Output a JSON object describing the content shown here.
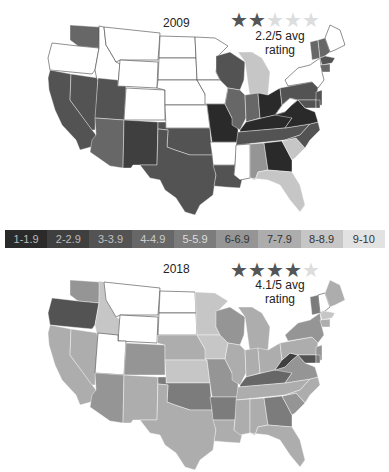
{
  "chart_data": {
    "type": "choropleth",
    "title": "",
    "legend": {
      "bins": [
        "1-1.9",
        "2-2.9",
        "3-3.9",
        "4-4.9",
        "5-5.9",
        "6-6.9",
        "7-7.9",
        "8-8.9",
        "9-10"
      ],
      "colors": [
        "#2a2a2a",
        "#3f3f3f",
        "#535353",
        "#676767",
        "#7c7c7c",
        "#959595",
        "#adadad",
        "#c6c6c6",
        "#e2e2e2"
      ],
      "text_colors": [
        "#bbbbbb",
        "#bbbbbb",
        "#c0c0c0",
        "#cccccc",
        "#dddddd",
        "#333333",
        "#333333",
        "#333333",
        "#333333"
      ]
    },
    "maps": [
      {
        "year": "2009",
        "stars_filled": 2,
        "stars_total": 5,
        "rating_label": "2.2/5 avg rating",
        "states": {
          "WA": "4-4.9",
          "OR": "none",
          "CA": "3-3.9",
          "NV": "3-3.9",
          "ID": "none",
          "MT": "none",
          "WY": "none",
          "UT": "3-3.9",
          "CO": "none",
          "AZ": "4-4.9",
          "NM": "2-2.9",
          "ND": "none",
          "SD": "none",
          "NE": "none",
          "KS": "none",
          "OK": "3-3.9",
          "TX": "3-3.9",
          "MN": "none",
          "IA": "none",
          "MO": "1-1.9",
          "AR": "none",
          "LA": "3-3.9",
          "WI": "3-3.9",
          "IL": "4-4.9",
          "MI": "8-8.9",
          "IN": "4-4.9",
          "OH": "1-1.9",
          "KY": "1-1.9",
          "TN": "3-3.9",
          "MS": "none",
          "AL": "6-6.9",
          "GA": "1-1.9",
          "FL": "8-8.9",
          "SC": "8-8.9",
          "NC": "3-3.9",
          "VA": "1-1.9",
          "WV": "none",
          "PA": "3-3.9",
          "NY": "none",
          "VT": "4-4.9",
          "NH": "4-4.9",
          "ME": "none",
          "MA": "3-3.9",
          "CT": "4-4.9",
          "NJ": "3-3.9",
          "MD": "3-3.9",
          "DE": "3-3.9"
        }
      },
      {
        "year": "2018",
        "stars_filled": 4,
        "stars_total": 5,
        "rating_label": "4.1/5 avg rating",
        "states": {
          "WA": "6-6.9",
          "OR": "3-3.9",
          "CA": "7-7.9",
          "NV": "7-7.9",
          "ID": "8-8.9",
          "MT": "none",
          "WY": "none",
          "UT": "none",
          "CO": "6-6.9",
          "AZ": "6-6.9",
          "NM": "7-7.9",
          "ND": "none",
          "SD": "none",
          "NE": "7-7.9",
          "KS": "8-8.9",
          "OK": "5-5.9",
          "TX": "7-7.9",
          "MN": "8-8.9",
          "IA": "8-8.9",
          "MO": "6-6.9",
          "AR": "5-5.9",
          "LA": "7-7.9",
          "WI": "6-6.9",
          "IL": "7-7.9",
          "MI": "7-7.9",
          "IN": "7-7.9",
          "OH": "7-7.9",
          "KY": "4-4.9",
          "TN": "7-7.9",
          "MS": "7-7.9",
          "AL": "7-7.9",
          "GA": "5-5.9",
          "FL": "7-7.9",
          "SC": "6-6.9",
          "NC": "7-7.9",
          "VA": "6-6.9",
          "WV": "2-2.9",
          "PA": "7-7.9",
          "NY": "6-6.9",
          "VT": "5-5.9",
          "NH": "none",
          "ME": "7-7.9",
          "MA": "8-8.9",
          "CT": "7-7.9",
          "NJ": "6-6.9",
          "MD": "3-3.9",
          "DE": "5-5.9"
        }
      }
    ]
  },
  "panels": {
    "p2009": {
      "year": "2009",
      "rating": "2.2/5 avg rating"
    },
    "p2018": {
      "year": "2018",
      "rating": "4.1/5 avg rating"
    }
  },
  "legend_labels": [
    "1-1.9",
    "2-2.9",
    "3-3.9",
    "4-4.9",
    "5-5.9",
    "6-6.9",
    "7-7.9",
    "8-8.9",
    "9-10"
  ],
  "star_glyph": "★",
  "star_colors": {
    "filled": "#555555",
    "empty": "#dddddd"
  }
}
